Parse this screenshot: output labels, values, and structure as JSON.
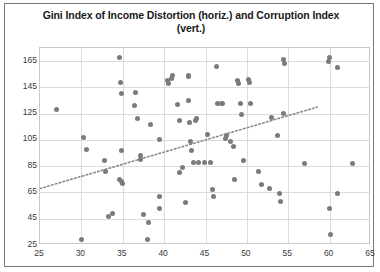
{
  "chart_data": {
    "type": "scatter",
    "title": "Gini Index of Income Distortion (horiz.) and Corruption Index (vert.)",
    "xlabel": "",
    "ylabel": "",
    "xlim": [
      25,
      65
    ],
    "ylim": [
      25,
      175
    ],
    "grid": true,
    "legend": "none",
    "xticks": [
      25,
      30,
      35,
      40,
      45,
      50,
      55,
      60,
      65
    ],
    "yticks": [
      25,
      45,
      65,
      85,
      105,
      125,
      145,
      165
    ],
    "marker_color": "#7b7b7b",
    "trendline": {
      "type": "linear-dotted",
      "color": "#8a8a8a",
      "x_start": 25.0,
      "y_start": 68.0,
      "x_end": 58.5,
      "y_end": 130.0
    },
    "points": [
      [
        27.0,
        128.0
      ],
      [
        30.2,
        107.0
      ],
      [
        30.6,
        98.0
      ],
      [
        30.0,
        29.0
      ],
      [
        32.8,
        89.0
      ],
      [
        32.9,
        81.0
      ],
      [
        33.3,
        47.0
      ],
      [
        33.8,
        49.0
      ],
      [
        34.6,
        168.0
      ],
      [
        34.7,
        149.0
      ],
      [
        34.8,
        140.0
      ],
      [
        34.9,
        97.0
      ],
      [
        34.6,
        75.0
      ],
      [
        34.9,
        73.0
      ],
      [
        35.0,
        72.0
      ],
      [
        36.5,
        141.0
      ],
      [
        36.4,
        131.0
      ],
      [
        36.8,
        121.0
      ],
      [
        37.1,
        93.0
      ],
      [
        37.2,
        90.0
      ],
      [
        37.5,
        48.0
      ],
      [
        38.0,
        29.0
      ],
      [
        38.1,
        42.0
      ],
      [
        38.3,
        117.0
      ],
      [
        39.5,
        105.0
      ],
      [
        39.4,
        62.0
      ],
      [
        39.5,
        53.0
      ],
      [
        40.4,
        150.0
      ],
      [
        40.5,
        148.0
      ],
      [
        40.9,
        152.0
      ],
      [
        41.0,
        154.0
      ],
      [
        41.6,
        132.0
      ],
      [
        41.8,
        120.0
      ],
      [
        41.9,
        80.0
      ],
      [
        42.2,
        84.0
      ],
      [
        42.6,
        57.0
      ],
      [
        42.9,
        153.0
      ],
      [
        43.0,
        154.0
      ],
      [
        43.0,
        135.0
      ],
      [
        43.1,
        118.0
      ],
      [
        43.2,
        104.0
      ],
      [
        43.3,
        97.0
      ],
      [
        43.5,
        88.0
      ],
      [
        43.9,
        121.0
      ],
      [
        43.8,
        120.0
      ],
      [
        44.2,
        88.0
      ],
      [
        44.9,
        88.0
      ],
      [
        45.6,
        88.0
      ],
      [
        45.2,
        109.0
      ],
      [
        45.8,
        67.0
      ],
      [
        46.0,
        62.0
      ],
      [
        46.3,
        161.0
      ],
      [
        46.5,
        133.0
      ],
      [
        46.9,
        133.0
      ],
      [
        47.0,
        133.0
      ],
      [
        47.4,
        106.0
      ],
      [
        47.5,
        108.0
      ],
      [
        48.0,
        104.0
      ],
      [
        48.5,
        75.0
      ],
      [
        48.4,
        100.0
      ],
      [
        48.9,
        150.0
      ],
      [
        49.0,
        148.0
      ],
      [
        49.2,
        133.0
      ],
      [
        49.4,
        124.0
      ],
      [
        49.6,
        89.0
      ],
      [
        50.2,
        151.0
      ],
      [
        50.3,
        149.0
      ],
      [
        50.4,
        133.0
      ],
      [
        51.4,
        81.0
      ],
      [
        51.8,
        71.0
      ],
      [
        52.7,
        68.0
      ],
      [
        53.0,
        122.0
      ],
      [
        53.7,
        108.0
      ],
      [
        54.0,
        64.0
      ],
      [
        54.1,
        58.0
      ],
      [
        54.4,
        166.0
      ],
      [
        54.5,
        163.0
      ],
      [
        54.4,
        125.0
      ],
      [
        57.0,
        87.0
      ],
      [
        59.9,
        165.0
      ],
      [
        60.0,
        168.0
      ],
      [
        60.0,
        53.0
      ],
      [
        60.1,
        33.0
      ],
      [
        60.9,
        160.0
      ],
      [
        61.0,
        64.0
      ],
      [
        62.8,
        87.0
      ]
    ]
  }
}
